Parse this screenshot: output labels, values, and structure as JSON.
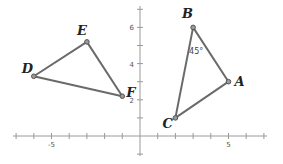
{
  "diagram": {
    "type": "coordinate-plane-triangles",
    "axes": {
      "x_range": [
        -7,
        7
      ],
      "y_range": [
        -1,
        7
      ],
      "x_tick_labels": [
        {
          "value": -5,
          "label": "-5"
        },
        {
          "value": 5,
          "label": "5"
        }
      ],
      "y_tick_labels": [
        {
          "value": 2,
          "label": "2"
        },
        {
          "value": 4,
          "label": "4"
        },
        {
          "value": 6,
          "label": "6"
        }
      ]
    },
    "triangles": [
      {
        "name": "ABC",
        "vertices": [
          {
            "label": "A",
            "x": 5,
            "y": 3
          },
          {
            "label": "B",
            "x": 3,
            "y": 6
          },
          {
            "label": "C",
            "x": 2,
            "y": 1
          }
        ],
        "angle_annotation": {
          "vertex": "B",
          "text": "45°"
        }
      },
      {
        "name": "DEF",
        "vertices": [
          {
            "label": "D",
            "x": -6,
            "y": 3.3
          },
          {
            "label": "E",
            "x": -3,
            "y": 5.2
          },
          {
            "label": "F",
            "x": -1,
            "y": 2.2
          }
        ]
      }
    ]
  }
}
